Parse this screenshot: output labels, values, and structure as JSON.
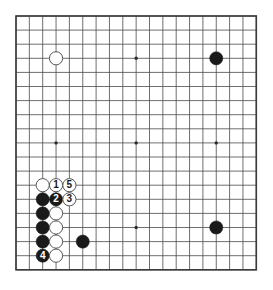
{
  "diagram": {
    "kind": "go-board-diagram",
    "board_size": 19,
    "title": "",
    "colors": {
      "board_background": "#ffffff",
      "grid_line": "#4a4a4a",
      "border_line": "#3b3b3b",
      "black_stone": "#1a1a1a",
      "white_stone": "#ffffff",
      "white_stone_outline": "#555555",
      "star_point": "#2b2b2b",
      "label_on_black": "#ffffff",
      "label_on_white": "#1a1a1a"
    },
    "geometry": {
      "origin_x": 16,
      "origin_y": 16,
      "step_x": 13.35,
      "step_y": 14.1,
      "stone_radius": 6.6,
      "star_radius": 1.7,
      "border_width": 1.6,
      "grid_width": 0.8
    },
    "star_points": [
      {
        "col": 3,
        "row": 3
      },
      {
        "col": 9,
        "row": 3
      },
      {
        "col": 15,
        "row": 3
      },
      {
        "col": 3,
        "row": 9
      },
      {
        "col": 9,
        "row": 9
      },
      {
        "col": 15,
        "row": 9
      },
      {
        "col": 3,
        "row": 15
      },
      {
        "col": 9,
        "row": 15
      },
      {
        "col": 15,
        "row": 15
      }
    ],
    "stones": [
      {
        "col": 3,
        "row": 3,
        "color": "white",
        "label": ""
      },
      {
        "col": 15,
        "row": 3,
        "color": "black",
        "label": ""
      },
      {
        "col": 15,
        "row": 15,
        "color": "black",
        "label": ""
      },
      {
        "col": 5,
        "row": 16,
        "color": "black",
        "label": ""
      },
      {
        "col": 2,
        "row": 12,
        "color": "white",
        "label": ""
      },
      {
        "col": 3,
        "row": 12,
        "color": "white",
        "label": "1"
      },
      {
        "col": 4,
        "row": 12,
        "color": "white",
        "label": "5"
      },
      {
        "col": 2,
        "row": 13,
        "color": "black",
        "label": ""
      },
      {
        "col": 3,
        "row": 13,
        "color": "black",
        "label": "2"
      },
      {
        "col": 4,
        "row": 13,
        "color": "white",
        "label": "3"
      },
      {
        "col": 2,
        "row": 14,
        "color": "black",
        "label": ""
      },
      {
        "col": 3,
        "row": 14,
        "color": "white",
        "label": ""
      },
      {
        "col": 2,
        "row": 15,
        "color": "black",
        "label": ""
      },
      {
        "col": 3,
        "row": 15,
        "color": "white",
        "label": ""
      },
      {
        "col": 2,
        "row": 16,
        "color": "black",
        "label": ""
      },
      {
        "col": 3,
        "row": 16,
        "color": "white",
        "label": ""
      },
      {
        "col": 2,
        "row": 17,
        "color": "black",
        "label": "4"
      },
      {
        "col": 3,
        "row": 17,
        "color": "white",
        "label": ""
      }
    ],
    "move_sequence": [
      {
        "number": "1",
        "color": "white"
      },
      {
        "number": "2",
        "color": "black"
      },
      {
        "number": "3",
        "color": "white"
      },
      {
        "number": "4",
        "color": "black"
      },
      {
        "number": "5",
        "color": "white"
      }
    ]
  }
}
